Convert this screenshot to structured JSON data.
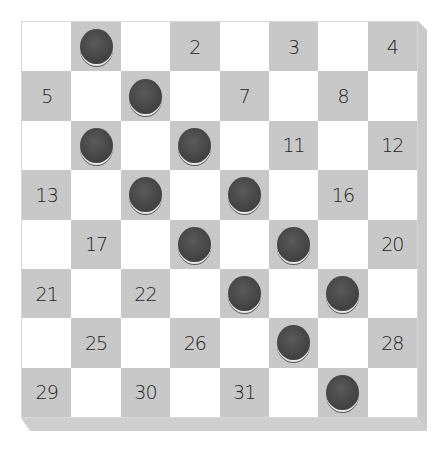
{
  "board": {
    "size": 8,
    "colors": {
      "light": "#ffffff",
      "dark": "#c8c8c8",
      "piece": "#444444"
    },
    "squares": [
      [
        {
          "num": ""
        },
        {
          "piece": true
        },
        {
          "num": ""
        },
        {
          "num": "2"
        },
        {
          "num": ""
        },
        {
          "num": "3"
        },
        {
          "num": ""
        },
        {
          "num": "4"
        }
      ],
      [
        {
          "num": "5"
        },
        {
          "num": ""
        },
        {
          "piece": true
        },
        {
          "num": ""
        },
        {
          "num": "7"
        },
        {
          "num": ""
        },
        {
          "num": "8"
        },
        {
          "num": ""
        }
      ],
      [
        {
          "num": ""
        },
        {
          "piece": true
        },
        {
          "num": ""
        },
        {
          "piece": true
        },
        {
          "num": ""
        },
        {
          "num": "11"
        },
        {
          "num": ""
        },
        {
          "num": "12"
        }
      ],
      [
        {
          "num": "13"
        },
        {
          "num": ""
        },
        {
          "piece": true
        },
        {
          "num": ""
        },
        {
          "piece": true
        },
        {
          "num": ""
        },
        {
          "num": "16"
        },
        {
          "num": ""
        }
      ],
      [
        {
          "num": ""
        },
        {
          "num": "17"
        },
        {
          "num": ""
        },
        {
          "piece": true
        },
        {
          "num": ""
        },
        {
          "piece": true
        },
        {
          "num": ""
        },
        {
          "num": "20"
        }
      ],
      [
        {
          "num": "21"
        },
        {
          "num": ""
        },
        {
          "num": "22"
        },
        {
          "num": ""
        },
        {
          "piece": true
        },
        {
          "num": ""
        },
        {
          "piece": true
        },
        {
          "num": ""
        }
      ],
      [
        {
          "num": ""
        },
        {
          "num": "25"
        },
        {
          "num": ""
        },
        {
          "num": "26"
        },
        {
          "num": ""
        },
        {
          "piece": true
        },
        {
          "num": ""
        },
        {
          "num": "28"
        }
      ],
      [
        {
          "num": "29"
        },
        {
          "num": ""
        },
        {
          "num": "30"
        },
        {
          "num": ""
        },
        {
          "num": "31"
        },
        {
          "num": ""
        },
        {
          "piece": true
        },
        {
          "num": ""
        }
      ]
    ]
  }
}
